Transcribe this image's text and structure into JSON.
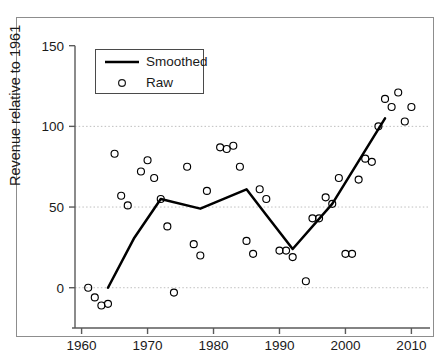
{
  "chart_data": {
    "type": "scatter",
    "title": "",
    "xlabel": "",
    "ylabel": "Revenue relative to 1961",
    "xlim": [
      1959.5,
      2011.0
    ],
    "ylim": [
      -18,
      155
    ],
    "xticks": [
      1960,
      1970,
      1980,
      1990,
      2000,
      2010
    ],
    "yticks": [
      0,
      50,
      100,
      150
    ],
    "grid": "horizontal-dotted at y = 0, 50, 100",
    "legend_position": "top-left inside axes",
    "series": [
      {
        "name": "Smoothed",
        "type": "line",
        "marker": "none",
        "color": "#000000",
        "x": [
          1964,
          1968,
          1972,
          1978,
          1985,
          1988,
          1992,
          1998,
          2006
        ],
        "values": [
          0,
          31,
          55,
          49,
          61,
          45,
          24,
          52,
          105
        ]
      },
      {
        "name": "Raw",
        "type": "scatter",
        "marker": "open-circle",
        "color": "#000000",
        "x": [
          1961,
          1962,
          1963,
          1964,
          1965,
          1966,
          1967,
          1969,
          1970,
          1971,
          1972,
          1973,
          1974,
          1976,
          1977,
          1978,
          1979,
          1981,
          1982,
          1983,
          1984,
          1985,
          1986,
          1987,
          1988,
          1990,
          1991,
          1992,
          1994,
          1995,
          1996,
          1997,
          1998,
          1999,
          2000,
          2001,
          2002,
          2003,
          2004,
          2005,
          2006,
          2007,
          2008,
          2009,
          2010
        ],
        "values": [
          0,
          -6,
          -11,
          -10,
          83,
          57,
          51,
          72,
          79,
          68,
          55,
          38,
          -3,
          75,
          27,
          20,
          60,
          87,
          86,
          88,
          75,
          29,
          21,
          61,
          55,
          23,
          23,
          19,
          4,
          43,
          43,
          56,
          52,
          68,
          21,
          21,
          67,
          80,
          78,
          100,
          117,
          112,
          121,
          103,
          112
        ]
      }
    ]
  },
  "axes": {
    "y_title": "Revenue relative to 1961",
    "x_tick_labels": [
      "1960",
      "1970",
      "1980",
      "1990",
      "2000",
      "2010"
    ],
    "y_tick_labels": [
      "0",
      "50",
      "100",
      "150"
    ]
  },
  "legend": {
    "entries": [
      {
        "label": "Smoothed",
        "symbol": "line"
      },
      {
        "label": "Raw",
        "symbol": "open-circle"
      }
    ]
  },
  "colors": {
    "ink": "#000000",
    "frame": "#8d8d8d",
    "grid": "#bfbfbf",
    "axis": "#5a5a5a"
  }
}
